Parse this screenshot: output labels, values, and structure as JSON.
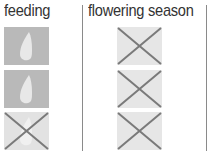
{
  "columns": [
    {
      "header": "feeding",
      "cells": [
        {
          "icon": "water-drop-icon",
          "state": "active"
        },
        {
          "icon": "water-drop-icon",
          "state": "active"
        },
        {
          "icon": "water-drop-crossed-icon",
          "state": "inactive"
        }
      ]
    },
    {
      "header": "flowering season",
      "cells": [
        {
          "icon": "cross-icon",
          "state": "inactive"
        },
        {
          "icon": "cross-icon",
          "state": "inactive"
        },
        {
          "icon": "cross-icon",
          "state": "inactive"
        }
      ]
    }
  ],
  "colors": {
    "active_bg": "#b9b9b9",
    "inactive_bg": "#e4e4e4",
    "drop": "#e8e8e8",
    "cross_stroke": "#7a7a7a",
    "divider": "#8a8a8a",
    "text": "#333333"
  }
}
